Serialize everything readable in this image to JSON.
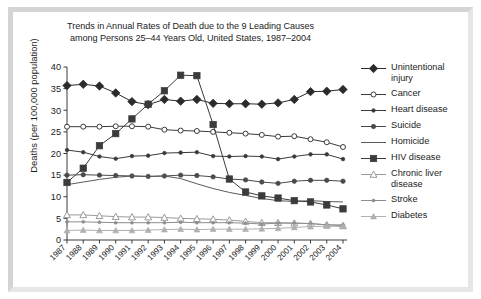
{
  "chart_data": {
    "type": "line",
    "title": "Trends in Annual Rates of Death due to the 9 Leading Causes among Persons 25–44 Years Old, United States, 1987–2004",
    "title_line1": "Trends in Annual Rates of Death due to the 9 Leading Causes",
    "title_line2": "among Persons 25–44 Years Old, United States, 1987–2004",
    "xlabel": "",
    "ylabel": "Deaths (per 100,000 population)",
    "ylim": [
      0,
      40
    ],
    "yticks": [
      0,
      5,
      10,
      15,
      20,
      25,
      30,
      35,
      40
    ],
    "grid": false,
    "legend_position": "right",
    "categories": [
      "1987",
      "1988",
      "1989",
      "1990",
      "1991",
      "1992",
      "1993",
      "1994",
      "1995",
      "1996",
      "1997",
      "1998",
      "1999",
      "2000",
      "2001",
      "2002",
      "2003",
      "2004"
    ],
    "series": [
      {
        "name": "Unintentional injury",
        "label_line1": "Unintentional",
        "label_line2": "injury",
        "marker": "diamond-filled",
        "color": "#2b2b2b",
        "values": [
          35.7,
          36.0,
          35.6,
          34.0,
          32.0,
          31.3,
          32.5,
          32.1,
          32.5,
          31.6,
          31.5,
          31.5,
          31.4,
          31.7,
          32.5,
          34.3,
          34.4,
          34.8
        ]
      },
      {
        "name": "Cancer",
        "label_line1": "Cancer",
        "label_line2": "",
        "marker": "circle-open",
        "color": "#3a3a3a",
        "values": [
          26.2,
          26.2,
          26.2,
          26.3,
          26.3,
          26.2,
          25.5,
          25.3,
          25.2,
          25.0,
          24.8,
          24.6,
          24.3,
          23.9,
          24.0,
          23.3,
          22.6,
          21.5
        ]
      },
      {
        "name": "Heart disease",
        "label_line1": "Heart disease",
        "label_line2": "",
        "marker": "circle-filled-small",
        "color": "#3a3a3a",
        "values": [
          20.8,
          20.3,
          19.3,
          18.8,
          19.4,
          19.5,
          20.1,
          20.2,
          20.3,
          19.4,
          19.3,
          19.4,
          19.3,
          18.7,
          19.3,
          19.8,
          19.8,
          18.7
        ]
      },
      {
        "name": "Suicide",
        "label_line1": "Suicide",
        "label_line2": "",
        "marker": "circle-filled",
        "color": "#4a4a4a",
        "values": [
          15.0,
          15.1,
          15.0,
          14.9,
          14.8,
          14.7,
          14.8,
          15.0,
          14.9,
          14.6,
          14.1,
          13.9,
          13.4,
          13.1,
          13.6,
          13.8,
          13.8,
          13.6
        ]
      },
      {
        "name": "Homicide",
        "label_line1": "Homicide",
        "label_line2": "",
        "marker": "none",
        "color": "#5a5a5a",
        "values": [
          12.8,
          13.4,
          14.0,
          14.5,
          14.8,
          14.7,
          14.8,
          14.2,
          13.0,
          11.9,
          11.0,
          10.3,
          9.6,
          9.1,
          8.9,
          9.1,
          8.9,
          8.8
        ]
      },
      {
        "name": "HIV disease",
        "label_line1": "HIV disease",
        "label_line2": "",
        "marker": "square-filled",
        "color": "#3b3b3b",
        "values": [
          13.3,
          16.6,
          21.8,
          24.6,
          28.0,
          31.4,
          34.5,
          38.1,
          38.0,
          26.7,
          14.1,
          11.1,
          10.2,
          9.7,
          9.1,
          8.8,
          8.1,
          7.2
        ]
      },
      {
        "name": "Chronic liver disease",
        "label_line1": "Chronic liver",
        "label_line2": "disease",
        "marker": "triangle-open",
        "color": "#9a9a9a",
        "values": [
          5.8,
          5.8,
          5.6,
          5.4,
          5.3,
          5.3,
          5.2,
          5.0,
          4.9,
          4.8,
          4.6,
          4.3,
          4.0,
          4.0,
          3.9,
          3.8,
          3.5,
          3.3
        ]
      },
      {
        "name": "Stroke",
        "label_line1": "Stroke",
        "label_line2": "",
        "marker": "dot-small",
        "color": "#8d8d8d",
        "values": [
          4.2,
          4.2,
          4.1,
          4.0,
          4.0,
          4.0,
          4.0,
          4.1,
          4.0,
          4.0,
          4.0,
          3.9,
          3.7,
          3.9,
          3.9,
          3.8,
          3.5,
          3.5
        ]
      },
      {
        "name": "Diabetes",
        "label_line1": "Diabetes",
        "label_line2": "",
        "marker": "triangle-filled",
        "color": "#b0b0b0",
        "values": [
          2.2,
          2.3,
          2.2,
          2.2,
          2.2,
          2.3,
          2.4,
          2.5,
          2.4,
          2.5,
          2.5,
          2.5,
          2.6,
          2.7,
          2.9,
          3.1,
          3.2,
          3.1
        ]
      }
    ]
  }
}
